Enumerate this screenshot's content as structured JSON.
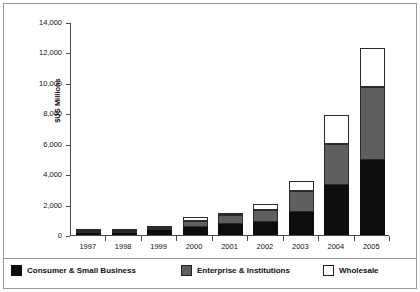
{
  "chart_data": {
    "type": "bar",
    "subtype": "stacked-column",
    "title": "",
    "xlabel": "",
    "ylabel": "$US Millions",
    "categories": [
      "1997",
      "1998",
      "1999",
      "2000",
      "2001",
      "2002",
      "2003",
      "2004",
      "2005"
    ],
    "ylim": [
      0,
      14000
    ],
    "yticks": [
      0,
      2000,
      4000,
      6000,
      8000,
      10000,
      12000,
      14000
    ],
    "ytick_labels": [
      "0",
      "2,000",
      "4,000",
      "6,000",
      "8,000",
      "10,000",
      "12,000",
      "14,000"
    ],
    "grid": false,
    "legend_position": "bottom",
    "series": [
      {
        "name": "Consumer & Small Business",
        "color": "#0d0d0d",
        "values": [
          100,
          150,
          300,
          500,
          700,
          850,
          1500,
          3300,
          4900
        ]
      },
      {
        "name": "Enterprise & Institutions",
        "color": "#5f5f5f",
        "values": [
          20,
          40,
          120,
          400,
          600,
          800,
          1400,
          2700,
          4800
        ]
      },
      {
        "name": "Wholesale",
        "color": "#ffffff",
        "values": [
          10,
          20,
          60,
          300,
          150,
          400,
          650,
          1900,
          2600
        ]
      }
    ],
    "totals": [
      130,
      210,
      480,
      1200,
      1450,
      2050,
      3550,
      7900,
      12300
    ]
  },
  "legend": {
    "items": [
      {
        "label": "Consumer & Small Business",
        "swatch": "black-square-icon"
      },
      {
        "label": "Enterprise & Institutions",
        "swatch": "gray-square-icon"
      },
      {
        "label": "Wholesale",
        "swatch": "white-square-icon"
      }
    ]
  }
}
